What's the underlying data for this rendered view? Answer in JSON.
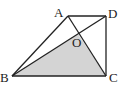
{
  "diagram": {
    "type": "geometry",
    "shape": "trapezoid",
    "points": {
      "A": {
        "label": "A",
        "x": 68,
        "y": 16
      },
      "D": {
        "label": "D",
        "x": 106,
        "y": 16
      },
      "B": {
        "label": "B",
        "x": 12,
        "y": 76
      },
      "C": {
        "label": "C",
        "x": 106,
        "y": 76
      },
      "O": {
        "label": "O",
        "x": 78,
        "y": 34
      }
    },
    "segments": [
      "AB",
      "AD",
      "DC",
      "BC",
      "AC",
      "BD"
    ],
    "shaded_region": "triangle OBC",
    "colors": {
      "line": "#222222",
      "fill": "#d4d4d4"
    }
  }
}
